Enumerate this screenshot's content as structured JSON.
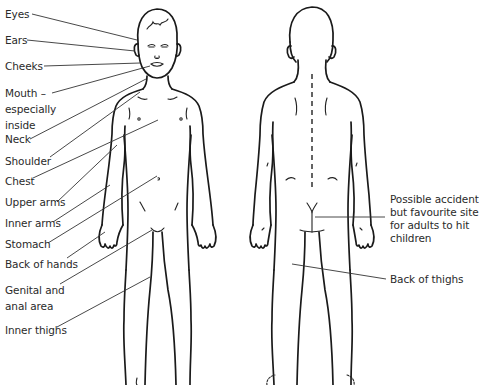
{
  "diagram": {
    "figures": [
      {
        "name": "front-view",
        "description": "child figure front view"
      },
      {
        "name": "back-view",
        "description": "child figure back view"
      }
    ],
    "left_labels": [
      {
        "id": "eyes",
        "lines": [
          "Eyes"
        ]
      },
      {
        "id": "ears",
        "lines": [
          "Ears"
        ]
      },
      {
        "id": "cheeks",
        "lines": [
          "Cheeks"
        ]
      },
      {
        "id": "mouth",
        "lines": [
          "Mouth –",
          "especially",
          "inside"
        ]
      },
      {
        "id": "neck",
        "lines": [
          "Neck"
        ]
      },
      {
        "id": "shoulder",
        "lines": [
          "Shoulder"
        ]
      },
      {
        "id": "chest",
        "lines": [
          "Chest"
        ]
      },
      {
        "id": "upper-arms",
        "lines": [
          "Upper arms"
        ]
      },
      {
        "id": "inner-arms",
        "lines": [
          "Inner arms"
        ]
      },
      {
        "id": "stomach",
        "lines": [
          "Stomach"
        ]
      },
      {
        "id": "back-of-hands",
        "lines": [
          "Back of hands"
        ]
      },
      {
        "id": "genital",
        "lines": [
          "Genital and",
          "anal area"
        ]
      },
      {
        "id": "inner-thighs",
        "lines": [
          "Inner thighs"
        ]
      }
    ],
    "right_labels": [
      {
        "id": "buttocks",
        "lines": [
          "Possible accident",
          "but favourite site",
          "for adults to hit",
          "children"
        ]
      },
      {
        "id": "back-of-thighs",
        "lines": [
          "Back of thighs"
        ]
      }
    ]
  }
}
